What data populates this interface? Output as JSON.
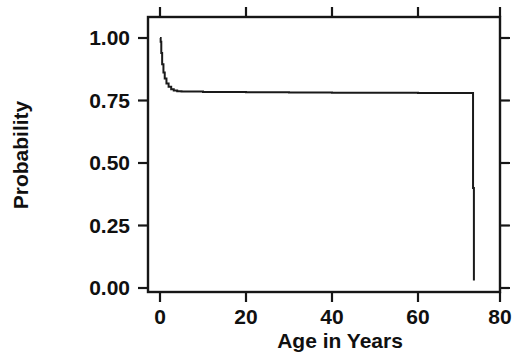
{
  "chart_data": {
    "type": "line",
    "title": "",
    "subtitle": "",
    "xlabel": "Age in Years",
    "ylabel": "Probability",
    "xlim": [
      -1.5,
      82
    ],
    "ylim": [
      -0.02,
      1.06
    ],
    "xticks": [
      0,
      20,
      40,
      60,
      80
    ],
    "xticklabels": [
      "0",
      "20",
      "40",
      "60",
      "80"
    ],
    "yticks": [
      0.0,
      0.25,
      0.5,
      0.75,
      1.0
    ],
    "yticklabels": [
      "0.00",
      "0.25",
      "0.50",
      "0.75",
      "1.00"
    ],
    "grid": false,
    "legend": null,
    "legend_position": "none",
    "annotations": [],
    "series": [
      {
        "name": "Survival probability",
        "style": "step-post",
        "color": "#1a1a1a",
        "x": [
          0.0,
          0.15,
          0.3,
          0.5,
          0.8,
          1.1,
          1.5,
          2.0,
          2.6,
          3.2,
          4.0,
          5.0,
          10.0,
          20.0,
          30.0,
          40.0,
          50.0,
          60.0,
          68.0,
          72.0,
          72.6,
          72.8,
          73.0
        ],
        "y": [
          1.0,
          0.985,
          0.94,
          0.895,
          0.862,
          0.838,
          0.818,
          0.805,
          0.795,
          0.79,
          0.787,
          0.786,
          0.784,
          0.783,
          0.782,
          0.781,
          0.781,
          0.78,
          0.78,
          0.78,
          0.78,
          0.4,
          0.03
        ]
      }
    ]
  },
  "axes": {
    "frame": "box-with-outward-ticks",
    "x_axis_name": "Age in Years",
    "y_axis_name": "Probability"
  }
}
